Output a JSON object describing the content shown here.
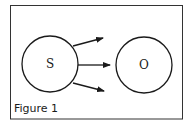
{
  "figure": {
    "caption": "Figure 1",
    "nodes": [
      {
        "id": "S",
        "label": "S"
      },
      {
        "id": "O",
        "label": "O"
      }
    ],
    "edges": [
      {
        "from": "S",
        "direction": "upper-right"
      },
      {
        "from": "S",
        "to": "O",
        "direction": "right"
      },
      {
        "from": "S",
        "direction": "lower-right"
      }
    ],
    "colors": {
      "stroke": "#1a1a1a",
      "background": "#ffffff"
    }
  }
}
